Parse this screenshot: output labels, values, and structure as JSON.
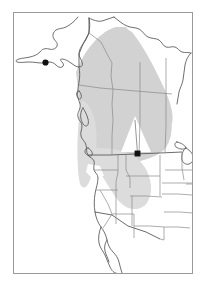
{
  "figure": {
    "kind": "distribution-range-map",
    "region": "Northwestern North America",
    "frame": {
      "x": 13,
      "y": 12,
      "width": 180,
      "height": 262,
      "stroke": "#9a9a9a"
    },
    "background_color": "#ffffff"
  },
  "legend_colors": {
    "range_shading": "#d2d2d2",
    "range_shading_light": "#e0e0e0",
    "coastline": "#555555",
    "state_border": "#8a8a8a",
    "country_border": "#5a5a5a",
    "locality_marker": "#111111",
    "frame_border": "#9a9a9a"
  },
  "localities": [
    {
      "name": "alaska-locality",
      "label": "",
      "x": 45.5,
      "y": 62.5,
      "r": 3.1
    },
    {
      "name": "montana-locality",
      "label": "",
      "x": 137.5,
      "y": 153.5,
      "r": 3.1
    }
  ],
  "leader_lines": [
    {
      "from": {
        "x": 137.5,
        "y": 153.5
      },
      "to": {
        "x": 135.0,
        "y": 120.0
      }
    }
  ],
  "chart_data": {
    "type": "map",
    "title": "",
    "xlabel": "",
    "ylabel": "",
    "projection": "unprojected-outline",
    "shaded_range_description": "Broad gray band extending from southern Alaska and Yukon southeast across British Columbia, Alberta and Saskatchewan into Montana, Wyoming, Idaho and Colorado",
    "marker_count": 2,
    "shaded_polygons": [
      {
        "name": "main-range-band",
        "fill": "#d2d2d2",
        "points": "86,53 95,40 108,30 118,27 124,31 128,42 138,60 150,78 162,96 170,110 172,122 168,134 160,146 150,152 140,149 132,140 124,132 114,124 104,116 96,108 90,98 86,86 84,72"
      },
      {
        "name": "north-canada-lobe",
        "fill": "#d2d2d2",
        "points": "96,40 112,28 126,30 140,48 156,74 168,98 172,116 162,118 150,104 136,84 122,64 108,50"
      },
      {
        "name": "prairie-extension",
        "fill": "#d2d2d2",
        "points": "84,98 100,96 120,98 142,104 160,112 170,122 168,138 156,150 140,156 124,158 108,156 94,150 86,138 82,120"
      },
      {
        "name": "us-rockies-extension",
        "fill": "#dcdcdc",
        "points": "88,150 100,148 116,150 132,156 144,166 150,180 148,196 140,206 130,208 120,202 112,190 102,176 92,164"
      },
      {
        "name": "pacific-coast-strip",
        "fill": "#dcdcdc",
        "points": "82,104 90,102 96,112 98,128 96,146 92,162 88,176 84,186 80,180 78,162 78,140 80,120"
      }
    ],
    "white_notch": {
      "name": "range-gap-triangle",
      "fill": "#ffffff",
      "points": "135,118 150,152 122,152"
    }
  }
}
